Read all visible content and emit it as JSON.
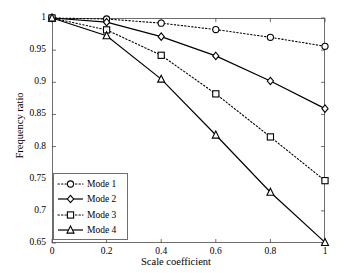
{
  "chart_data": {
    "type": "line",
    "title": "",
    "xlabel": "Scale coefficient",
    "ylabel": "Frequency ratio",
    "x": [
      0,
      0.2,
      0.4,
      0.6,
      0.8,
      1
    ],
    "xlim": [
      0,
      1
    ],
    "ylim": [
      0.65,
      1
    ],
    "xticks": [
      "0",
      "0.2",
      "0.4",
      "0.6",
      "0.8",
      "1"
    ],
    "yticks": [
      "0.65",
      "0.7",
      "0.75",
      "0.8",
      "0.85",
      "0.9",
      "0.95",
      "1"
    ],
    "grid": false,
    "legend_position": "lower-left",
    "series": [
      {
        "name": "Mode 1",
        "marker": "circle",
        "linestyle": "dotted",
        "color": "#000000",
        "values": [
          1,
          0.9985,
          0.992,
          0.982,
          0.97,
          0.956
        ]
      },
      {
        "name": "Mode 2",
        "marker": "diamond",
        "linestyle": "solid",
        "color": "#000000",
        "values": [
          1,
          0.9935,
          0.971,
          0.941,
          0.902,
          0.859
        ]
      },
      {
        "name": "Mode 3",
        "marker": "square",
        "linestyle": "dotted",
        "color": "#000000",
        "values": [
          1,
          0.9815,
          0.942,
          0.882,
          0.815,
          0.747
        ]
      },
      {
        "name": "Mode 4",
        "marker": "triangle",
        "linestyle": "solid",
        "color": "#000000",
        "values": [
          1,
          0.9725,
          0.905,
          0.818,
          0.729,
          0.651
        ]
      }
    ]
  },
  "legend": {
    "items": [
      {
        "label": "Mode 1"
      },
      {
        "label": "Mode 2"
      },
      {
        "label": "Mode 3"
      },
      {
        "label": "Mode 4"
      }
    ]
  },
  "axes": {
    "x_title": "Scale coefficient",
    "y_title": "Frequency ratio"
  }
}
